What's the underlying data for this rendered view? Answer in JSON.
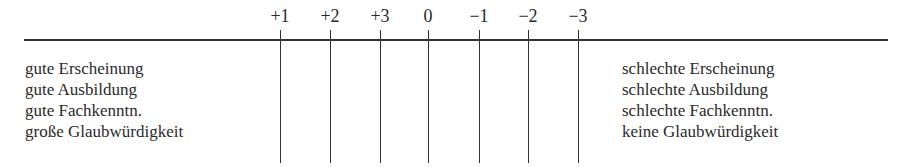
{
  "scale": {
    "labels": [
      "+1",
      "+2",
      "+3",
      "0",
      "−1",
      "−2",
      "−3"
    ],
    "positions_px": [
      280,
      330,
      380,
      428,
      479,
      528,
      578
    ]
  },
  "left_adjectives": [
    "gute Erscheinung",
    "gute Ausbildung",
    "gute Fachkenntn.",
    "große Glaubwürdigkeit"
  ],
  "right_adjectives": [
    "schlechte Erscheinung",
    "schlechte Ausbildung",
    "schlechte Fachkenntn.",
    "keine Glaubwürdigkeit"
  ]
}
